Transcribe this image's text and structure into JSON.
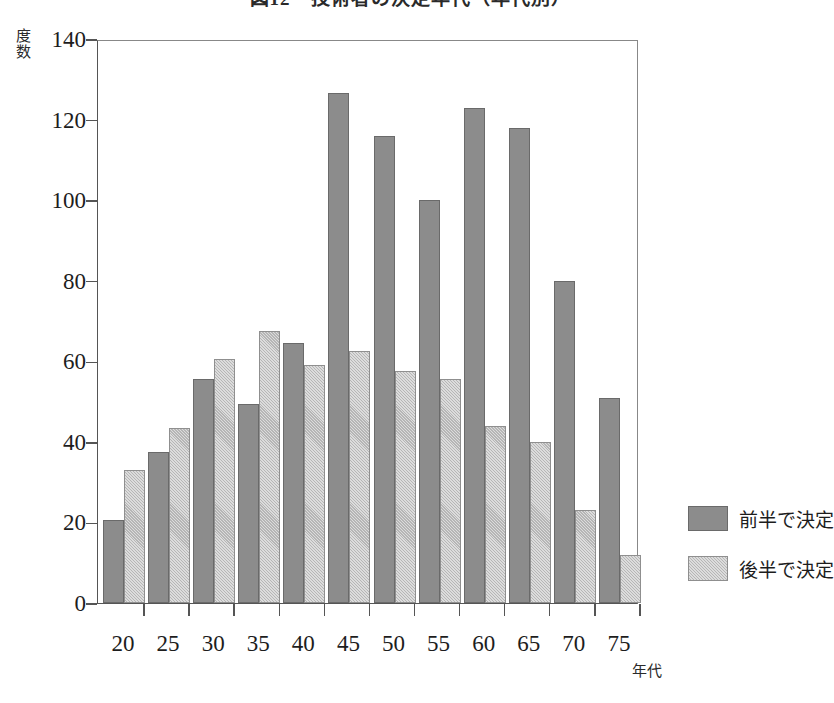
{
  "chart_data": {
    "type": "bar",
    "title": "図12　技術者の決定年代（年代別）",
    "xlabel": "年代",
    "ylabel": "度数",
    "categories": [
      "20",
      "25",
      "30",
      "35",
      "40",
      "45",
      "50",
      "55",
      "60",
      "65",
      "70",
      "75"
    ],
    "ylim": [
      0,
      140
    ],
    "yticks": [
      0,
      20,
      40,
      60,
      80,
      100,
      120,
      140
    ],
    "grid": false,
    "legend_position": "right",
    "series": [
      {
        "name": "前半で決定",
        "color": "#8c8c8c",
        "fill": "solid",
        "values": [
          20.5,
          37.5,
          55.5,
          49.5,
          64.5,
          126.5,
          116,
          100,
          123,
          118,
          80,
          51
        ]
      },
      {
        "name": "後半で決定",
        "color": "#dcdcdc",
        "fill": "hatched-diagonal",
        "values": [
          33,
          43.5,
          60.5,
          67.5,
          59,
          62.5,
          57.5,
          55.5,
          44,
          40,
          23,
          12
        ]
      }
    ]
  },
  "axes": {
    "y_axis_label": "度数",
    "x_axis_label": "年代"
  }
}
